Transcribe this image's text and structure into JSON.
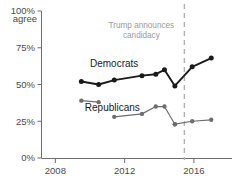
{
  "chart_data": {
    "type": "line",
    "title": "",
    "subtitle": "",
    "xlabel": "",
    "ylabel": "100% agree",
    "y_axis_top_label_line1": "100%",
    "y_axis_top_label_line2": "agree",
    "xlim": [
      2007.2,
      2018.2
    ],
    "ylim": [
      0,
      100
    ],
    "grid": false,
    "legend_position": "inline-labels",
    "yticks": [
      0,
      25,
      50,
      75,
      100
    ],
    "ytick_labels": [
      "0%",
      "25%",
      "50%",
      "75%",
      "100%"
    ],
    "xticks": [
      2008,
      2012,
      2016
    ],
    "xtick_labels": [
      "2008",
      "2012",
      "2016"
    ],
    "series": [
      {
        "name": "Democrats",
        "color": "#1a1a1a",
        "segments": [
          {
            "x": [
              2009.5,
              2010.5,
              2011.4,
              2013.0,
              2013.8,
              2014.3,
              2014.9,
              2015.9,
              2017.0
            ],
            "y": [
              52,
              50,
              53,
              56,
              57,
              60,
              49,
              62,
              68
            ]
          }
        ]
      },
      {
        "name": "Republicans",
        "color": "#6e6e6e",
        "segments": [
          {
            "x": [
              2009.5,
              2010.5
            ],
            "y": [
              39,
              38
            ]
          },
          {
            "x": [
              2011.4,
              2013.0,
              2013.8,
              2014.3,
              2014.9
            ],
            "y": [
              28,
              30,
              35,
              35,
              23
            ]
          },
          {
            "x": [
              2014.9,
              2015.9,
              2017.0
            ],
            "y": [
              23,
              25,
              26
            ]
          }
        ]
      }
    ],
    "annotations": [
      {
        "name": "trump-announces-candidacy",
        "text_line1": "Trump announces",
        "text_line2": "candidacy",
        "x": 2015.45,
        "style": "dashed-vertical-rule",
        "color": "#b0b0b0"
      }
    ],
    "series_inline_labels": [
      {
        "name": "Democrats",
        "x": 2010.0,
        "y": 62
      },
      {
        "name": "Republicans",
        "x": 2009.7,
        "y": 32
      }
    ]
  }
}
